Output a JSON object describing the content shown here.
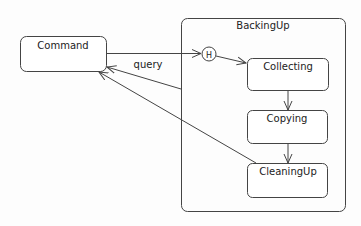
{
  "diagram": {
    "type": "state-machine",
    "states": [
      {
        "id": "command",
        "label": "Command"
      },
      {
        "id": "backingup",
        "label": "BackingUp",
        "composite": true
      },
      {
        "id": "collecting",
        "label": "Collecting"
      },
      {
        "id": "copying",
        "label": "Copying"
      },
      {
        "id": "cleaningup",
        "label": "CleaningUp"
      }
    ],
    "history": {
      "label": "H"
    },
    "transitions": [
      {
        "from": "command",
        "to": "history",
        "label": ""
      },
      {
        "from": "history",
        "to": "collecting",
        "label": ""
      },
      {
        "from": "collecting",
        "to": "copying",
        "label": ""
      },
      {
        "from": "copying",
        "to": "cleaningup",
        "label": ""
      },
      {
        "from": "backingup",
        "to": "command",
        "label": "query"
      },
      {
        "from": "cleaningup",
        "to": "command",
        "label": ""
      }
    ],
    "query_label": "query",
    "colors": {
      "stroke": "#444444",
      "fill": "#ffffff",
      "text": "#222222"
    }
  }
}
